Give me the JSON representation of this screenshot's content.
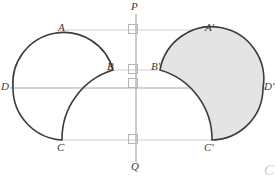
{
  "figure": {
    "colors": {
      "outline": "#3c3c3c",
      "guide_line": "#cccccc",
      "axis_line": "#a8a8a8",
      "shade_fill": "#e2e2e2",
      "label_text": "#3a3a3a",
      "right_angle_mark": "#b5b5b5",
      "background": "#ffffff",
      "corner_mark": "#cfcfcf"
    },
    "labels": {
      "P": "P",
      "Q": "Q",
      "D": "D",
      "D_prime": "D'",
      "A": "A",
      "A_prime": "A'",
      "B": "B",
      "B_prime": "B'",
      "C": "C",
      "C_prime": "C'"
    },
    "corner_mark": "C",
    "geometry": {
      "mirror_axis": {
        "name": "PQ",
        "x": 136,
        "y_top": 14,
        "y_bottom": 162
      },
      "base_line": {
        "name": "DD'",
        "y": 88,
        "x_left": 13,
        "x_right": 263
      },
      "guide_lines": [
        {
          "name": "AA-prime",
          "y": 30,
          "x_left": 68,
          "x_right": 208
        },
        {
          "name": "BB-prime",
          "y": 70,
          "x_left": 113,
          "x_right": 160
        },
        {
          "name": "CC-prime",
          "y": 140,
          "x_left": 62,
          "x_right": 212
        }
      ],
      "points": {
        "P": {
          "x": 136,
          "y": 10
        },
        "Q": {
          "x": 136,
          "y": 168
        },
        "D": {
          "x": 13,
          "y": 88
        },
        "D_prime": {
          "x": 263,
          "y": 88
        },
        "A": {
          "x": 68,
          "y": 30
        },
        "A_prime": {
          "x": 208,
          "y": 30
        },
        "B": {
          "x": 113,
          "y": 70
        },
        "B_prime": {
          "x": 160,
          "y": 70
        },
        "C": {
          "x": 62,
          "y": 140
        },
        "C_prime": {
          "x": 212,
          "y": 140
        }
      },
      "right_angle_marks": [
        {
          "name": "mark-at-AA-prime",
          "x": 129,
          "y": 24,
          "size": 9
        },
        {
          "name": "mark-at-BB-prime",
          "x": 129,
          "y": 64,
          "size": 9
        },
        {
          "name": "mark-at-DD-prime",
          "x": 129,
          "y": 79,
          "size": 9
        },
        {
          "name": "mark-at-CC-prime",
          "x": 129,
          "y": 134,
          "size": 9
        }
      ],
      "left_outline_path": "M 13 88 A 50 50 0 0 1 113 70 A 72 72 0 0 0 62 140 A 52 52 0 0 1 13 88",
      "right_outline_path": "M 263 88 A 50 50 0 0 0 160 70 A 72 72 0 0 1 212 140 A 52 52 0 0 0 263 88"
    },
    "label_positions": {
      "P": {
        "left": 132,
        "top": 1
      },
      "Q": {
        "left": 132,
        "top": 162
      },
      "D": {
        "left": 2,
        "top": 82
      },
      "D_prime": {
        "left": 263,
        "top": 82
      },
      "A": {
        "left": 59,
        "top": 22
      },
      "A_prime": {
        "left": 206,
        "top": 22
      },
      "B": {
        "left": 108,
        "top": 62
      },
      "B_prime": {
        "left": 152,
        "top": 62
      },
      "C": {
        "left": 58,
        "top": 143
      },
      "C_prime": {
        "left": 206,
        "top": 143
      }
    }
  }
}
